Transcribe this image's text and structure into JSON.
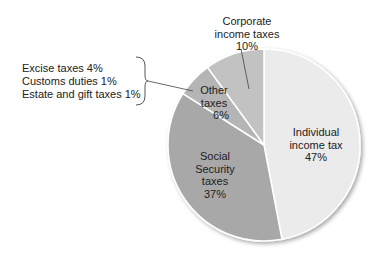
{
  "chart_data": {
    "type": "pie",
    "title": "",
    "start_angle": "12 o'clock, clockwise",
    "slices": [
      {
        "label": "Individual income tax",
        "value": 47,
        "color": "#ebebeb"
      },
      {
        "label": "Social Security taxes",
        "value": 37,
        "color": "#a8a8a8"
      },
      {
        "label": "Other taxes",
        "value": 6,
        "color": "#b5b5b5"
      },
      {
        "label": "Corporate income taxes",
        "value": 10,
        "color": "#c2c2c2"
      }
    ],
    "breakdown": {
      "of": "Other taxes",
      "items": [
        {
          "label": "Excise taxes",
          "value": 4
        },
        {
          "label": "Customs duties",
          "value": 1
        },
        {
          "label": "Estate and gift taxes",
          "value": 1
        }
      ]
    }
  },
  "labels": {
    "individual": {
      "line1": "Individual",
      "line2": "income tax",
      "pct": "47%"
    },
    "social": {
      "line1": "Social",
      "line2": "Security",
      "line3": "taxes",
      "pct": "37%"
    },
    "other": {
      "line1": "Other",
      "line2": "taxes",
      "pct": "6%"
    },
    "corporate": {
      "line1": "Corporate",
      "line2": "income taxes",
      "pct": "10%"
    },
    "breakdown": [
      "Excise taxes 4%",
      "Customs duties 1%",
      "Estate and gift taxes 1%"
    ]
  }
}
